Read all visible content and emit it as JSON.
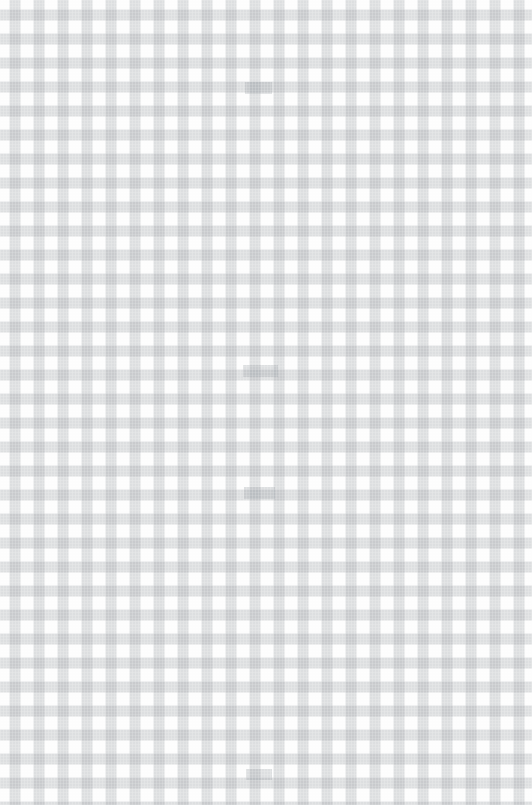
{
  "image": {
    "title": "Gingham check fabric texture",
    "width": 532,
    "height": 805,
    "subject": "light gray gingham / checkered woven cloth, soft focus"
  },
  "palette": {
    "background": "#fdfdfd",
    "cloth_white": "#fbfbfb",
    "stripe_gray": "#969ba0",
    "stripe_alpha": 0.34,
    "check_dark": "#c6c9cc",
    "check_light": "#f4f4f5"
  },
  "pattern": {
    "type": "gingham",
    "period_px": 24,
    "stripe_width_px": 11,
    "stripe_offset_px": 9,
    "orientation": "orthogonal",
    "columns": 23,
    "rows": 34
  },
  "anomalies": [
    {
      "name": "filled-cell-1",
      "x": 245,
      "y": 82,
      "width": 27,
      "height": 12
    },
    {
      "name": "filled-cell-2",
      "x": 243,
      "y": 365,
      "width": 35,
      "height": 12
    },
    {
      "name": "filled-cell-3",
      "x": 244,
      "y": 487,
      "width": 31,
      "height": 12
    },
    {
      "name": "filled-cell-4",
      "x": 246,
      "y": 769,
      "width": 26,
      "height": 11
    }
  ]
}
